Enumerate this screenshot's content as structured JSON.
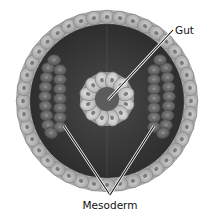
{
  "diagram": {
    "labels": {
      "gut": "Gut",
      "mesoderm": "Mesoderm"
    },
    "colors": {
      "background": "#ffffff",
      "outer_cell": "#b4b4b4",
      "outer_cell_edge": "#8a8a8a",
      "cavity": "#3a3a3a",
      "mesoderm_cell": "#6e6e6e",
      "gut_cell": "#c8c8c8",
      "gut_lumen": "#5a5a5a",
      "nucleus": "#7a7a7a",
      "leader_line": "#111111",
      "leader_halo": "#ffffff"
    },
    "structures": [
      {
        "name": "ectoderm",
        "shape": "ring of cells",
        "cell_count": 40
      },
      {
        "name": "gut",
        "shape": "ring of cells",
        "cell_count": 12
      },
      {
        "name": "mesoderm-left",
        "shape": "double column of cells"
      },
      {
        "name": "mesoderm-right",
        "shape": "double column of cells"
      }
    ]
  }
}
